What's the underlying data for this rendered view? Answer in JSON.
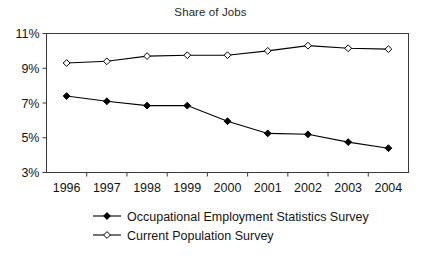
{
  "chart_data": {
    "type": "line",
    "title": "Share of Jobs",
    "xlabel": "",
    "ylabel": "",
    "grid": false,
    "legend_position": "bottom",
    "categories": [
      "1996",
      "1997",
      "1998",
      "1999",
      "2000",
      "2001",
      "2002",
      "2003",
      "2004"
    ],
    "x": [
      1996,
      1997,
      1998,
      1999,
      2000,
      2001,
      2002,
      2003,
      2004
    ],
    "ylim": [
      3,
      11
    ],
    "yticks": [
      3,
      5,
      7,
      9,
      11
    ],
    "ytick_labels": [
      "3%",
      "5%",
      "7%",
      "9%",
      "11%"
    ],
    "xtick_labels": [
      "1996",
      "1997",
      "1998",
      "1999",
      "2000",
      "2001",
      "2002",
      "2003",
      "2004"
    ],
    "series": [
      {
        "name": "Occupational Employment Statistics Survey",
        "marker": "filled-diamond",
        "color": "#000000",
        "values": [
          7.4,
          7.1,
          6.85,
          6.85,
          5.95,
          5.25,
          5.2,
          4.75,
          4.4
        ]
      },
      {
        "name": "Current Population Survey",
        "marker": "open-diamond",
        "color": "#000000",
        "values": [
          9.3,
          9.4,
          9.7,
          9.75,
          9.75,
          10.0,
          10.3,
          10.15,
          10.1
        ]
      }
    ]
  },
  "legend": {
    "entries": [
      {
        "label": "Occupational Employment Statistics Survey",
        "marker": "filled-diamond"
      },
      {
        "label": "Current Population Survey",
        "marker": "open-diamond"
      }
    ]
  },
  "colors": {
    "axis": "#3a3a3a",
    "line": "#000000",
    "text": "#141414",
    "background": "#ffffff"
  }
}
